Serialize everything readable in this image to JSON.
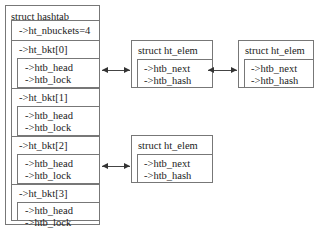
{
  "hashtab": {
    "title": "struct hashtab",
    "nbuckets": "->ht_nbuckets=4",
    "buckets": [
      {
        "label": "->ht_bkt[0]",
        "head": "->htb_head",
        "lock": "->htb_lock"
      },
      {
        "label": "->ht_bkt[1]",
        "head": "->htb_head",
        "lock": "->htb_lock"
      },
      {
        "label": "->ht_bkt[2]",
        "head": "->htb_head",
        "lock": "->htb_lock"
      },
      {
        "label": "->ht_bkt[3]",
        "head": "->htb_head",
        "lock": "->htb_lock"
      }
    ]
  },
  "elems": [
    {
      "title": "struct ht_elem",
      "next": "->htb_next",
      "hash": "->htb_hash"
    },
    {
      "title": "struct ht_elem",
      "next": "->htb_next",
      "hash": "->htb_hash"
    },
    {
      "title": "struct ht_elem",
      "next": "->htb_next",
      "hash": "->htb_hash"
    }
  ]
}
